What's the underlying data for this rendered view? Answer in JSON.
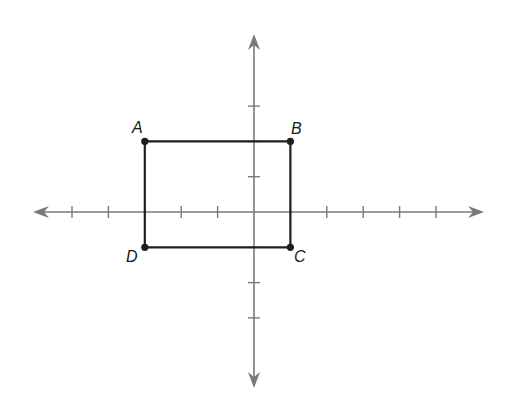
{
  "diagram": {
    "type": "coordinate-plane",
    "colors": {
      "background": "#ffffff",
      "axis": "#7a7a7a",
      "shape": "#1f1f1f",
      "label": "#1a1a1a"
    },
    "grid": {
      "origin_px": {
        "x": 254,
        "y": 212
      },
      "unit_px_x": 36.4,
      "unit_px_y": 35.3,
      "x_axis_px": {
        "left": 33,
        "right": 484
      },
      "y_axis_px": {
        "top": 34,
        "bottom": 388
      },
      "x_ticks": [
        -5,
        -4,
        -3,
        -2,
        -1,
        1,
        2,
        3,
        4,
        5
      ],
      "y_ticks": [
        -3,
        -2,
        -1,
        1,
        2,
        3
      ]
    },
    "shape": {
      "name": "rectangle ABCD",
      "vertices": [
        {
          "label": "A",
          "x": -3,
          "y": 2
        },
        {
          "label": "B",
          "x": 1,
          "y": 2
        },
        {
          "label": "C",
          "x": 1,
          "y": -1
        },
        {
          "label": "D",
          "x": -3,
          "y": -1
        }
      ]
    }
  },
  "labels": {
    "A": "A",
    "B": "B",
    "C": "C",
    "D": "D"
  }
}
